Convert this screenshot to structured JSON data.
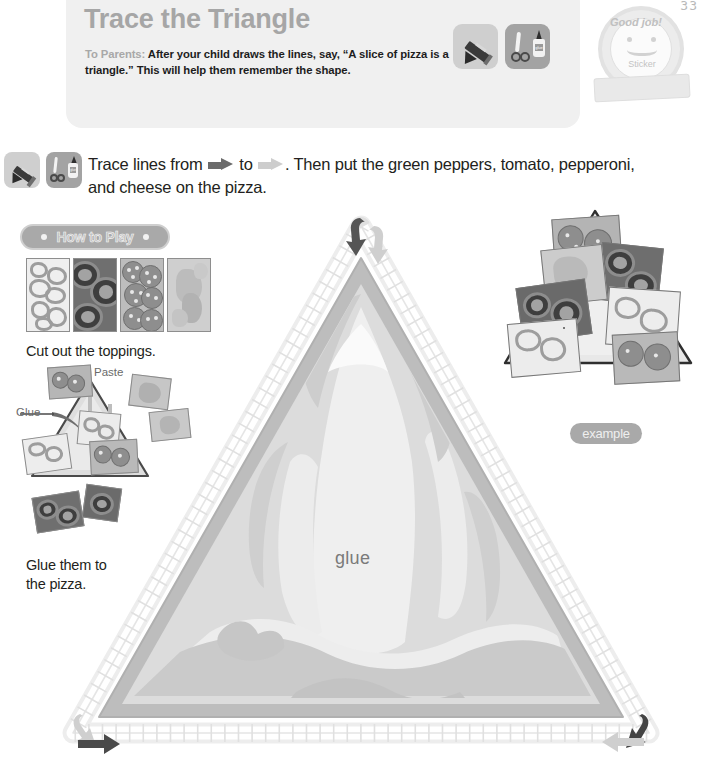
{
  "page": {
    "number": "33",
    "accent_gray": "#a9a9a9",
    "text_color": "#231f20",
    "panel_bg": "#f0f0f0"
  },
  "header": {
    "title": "Trace the Triangle",
    "parents_label": "To Parents:",
    "parents_text": " After your child draws the lines, say, “A slice of pizza is a triangle.” This will help them remember the shape.",
    "tools": [
      {
        "name": "crayon-tool-icon",
        "label": "crayon"
      },
      {
        "name": "scissors-glue-tool-icon",
        "label": "scissors and glue"
      }
    ]
  },
  "sticker": {
    "label": "Sticker",
    "ribbon_text": "Good job!"
  },
  "instruction": {
    "part1": "Trace lines from ",
    "arrow_start": "dark-arrow",
    "part2": " to ",
    "arrow_end": "light-arrow",
    "part3": ". Then put the green peppers, tomato, pepperoni, and cheese on the pizza."
  },
  "how_to_play": {
    "pill_label": "How to Play",
    "steps": [
      {
        "caption": "Cut out the toppings.",
        "cards": [
          {
            "name": "green-peppers-card",
            "label": "green peppers"
          },
          {
            "name": "tomato-card",
            "label": "tomato"
          },
          {
            "name": "pepperoni-card",
            "label": "pepperoni"
          },
          {
            "name": "cheese-card",
            "label": "cheese"
          }
        ]
      },
      {
        "caption_line1": "Glue them to",
        "caption_line2": "the pizza.",
        "labels": {
          "paste": "Paste",
          "glue": "Glue"
        }
      }
    ]
  },
  "example": {
    "label": "example"
  },
  "main_activity": {
    "glue_word": "glue",
    "start_marker": "dark-arrow-start",
    "end_marker": "light-arrow-end",
    "corner_markers": [
      "apex-start-arrow",
      "bottom-left-arrow",
      "bottom-right-arrow"
    ],
    "crust_color": "#b4b4b4",
    "cheese_color": "#e3e3e3",
    "track_color": "#e8e8e8"
  }
}
